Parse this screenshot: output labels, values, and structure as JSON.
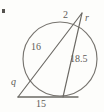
{
  "figure": {
    "background_color": "#fdfdfb",
    "stroke_color": "#6b6964",
    "label_color": "#5e5c58",
    "labels": {
      "chord_left": "16",
      "chord_right": "18.5",
      "external_top": "2",
      "radius_or_segment": "r",
      "external_lower_left": "q",
      "tangent_bottom": "15"
    },
    "geometry": {
      "circle": {
        "cx": 60,
        "cy": 59,
        "r": 37
      },
      "apex": {
        "x": 82,
        "y": 13
      },
      "left_vertex": {
        "x": 18,
        "y": 97
      },
      "secant_left_entry": {
        "x": 27,
        "y": 72
      },
      "secant_left_exit": {
        "x": 72,
        "y": 23
      },
      "chord_right_top": {
        "x": 85,
        "y": 25
      },
      "chord_right_bottom": {
        "x": 63,
        "y": 96
      },
      "tangent_right_end": {
        "x": 78,
        "y": 97
      }
    }
  }
}
